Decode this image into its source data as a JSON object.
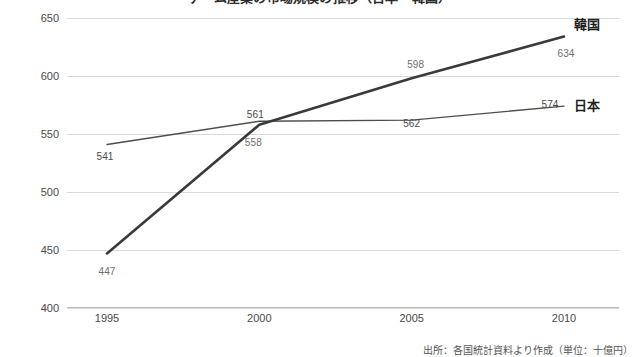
{
  "chart_data": {
    "type": "line",
    "title": "ゲーム産業の市場規模の推移（日本・韓国）",
    "footnote": "出所：各国統計資料より作成（単位：十億円）",
    "xlabel": "",
    "ylabel": "",
    "x": [
      "1995",
      "2000",
      "2005",
      "2010"
    ],
    "categories": [
      "1995",
      "2000",
      "2005",
      "2010"
    ],
    "ylim": [
      400,
      650
    ],
    "yticks": [
      "400",
      "450",
      "500",
      "550",
      "600",
      "650"
    ],
    "grid": true,
    "legend_position": "line-end-labels",
    "series": [
      {
        "name": "日本",
        "values": [
          541,
          561,
          562,
          574
        ],
        "labels": [
          "541",
          "561",
          "562",
          "574"
        ],
        "color": "#4d4d4d",
        "width": 1.4
      },
      {
        "name": "韓国",
        "values": [
          447,
          558,
          598,
          634
        ],
        "labels": [
          "447",
          "558",
          "598",
          "634"
        ],
        "color": "#3a3a3a",
        "width": 2.6
      }
    ],
    "annotations": [
      {
        "text": "541",
        "series": "日本",
        "x": "1995",
        "value": 541
      },
      {
        "text": "561",
        "series": "日本",
        "x": "2000",
        "value": 561
      },
      {
        "text": "562",
        "series": "日本",
        "x": "2005",
        "value": 562
      },
      {
        "text": "574",
        "series": "日本",
        "x": "2010",
        "value": 574
      },
      {
        "text": "447",
        "series": "韓国",
        "x": "1995",
        "value": 447
      },
      {
        "text": "558",
        "series": "韓国",
        "x": "2000",
        "value": 558
      },
      {
        "text": "598",
        "series": "韓国",
        "x": "2005",
        "value": 598
      },
      {
        "text": "634",
        "series": "韓国",
        "x": "2010",
        "value": 634
      }
    ]
  }
}
